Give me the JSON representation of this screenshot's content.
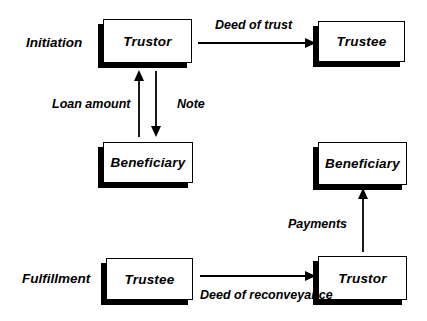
{
  "diagram": {
    "phases": {
      "initiation": "Initiation",
      "fulfillment": "Fulfillment"
    },
    "boxes": {
      "trustor_top": "Trustor",
      "trustee_top": "Trustee",
      "beneficiary_left": "Beneficiary",
      "beneficiary_right": "Beneficiary",
      "trustee_bottom": "Trustee",
      "trustor_bottom": "Trustor"
    },
    "arrows": {
      "deed_of_trust": "Deed of trust",
      "loan_amount": "Loan amount",
      "note": "Note",
      "payments": "Payments",
      "deed_of_reconveyance": "Deed of reconveyance"
    },
    "colors": {
      "background": "#ffffff",
      "box_fill": "#ffffff",
      "box_border": "#000000",
      "box_shadow": "#000000",
      "arrow": "#000000",
      "text": "#000000"
    }
  }
}
